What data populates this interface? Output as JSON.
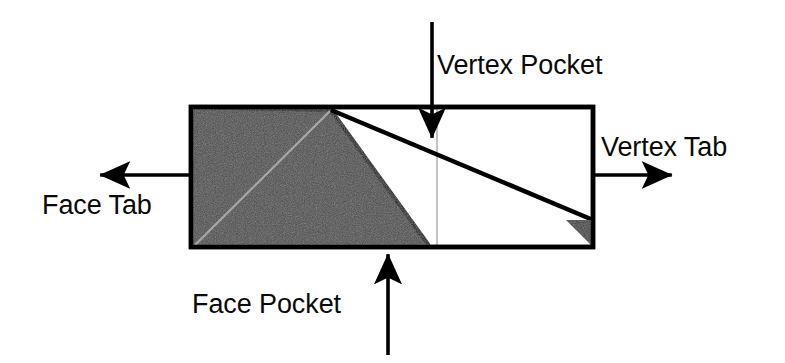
{
  "figure": {
    "colors": {
      "outline": "#000000",
      "fill_dark": "#4a4a4a",
      "fill_light": "#ffffff",
      "hint_line": "#a8a8a8",
      "text": "#0a0a0a",
      "background": "#ffffff"
    },
    "labels": {
      "vertex_pocket": "Vertex Pocket",
      "vertex_tab": "Vertex Tab",
      "face_tab": "Face Tab",
      "face_pocket": "Face Pocket"
    },
    "shape": {
      "name": "parallelogram-strip",
      "outline_points": "191,107 593,107 593,247 191,247",
      "dark_triangle_points": "191,107 331,110 430,247 191,247",
      "corner_triangle_points": "566,220 593,220 593,247",
      "crease_diagonal": {
        "x1": 195,
        "y1": 245,
        "x2": 330,
        "y2": 111
      },
      "long_diagonal": {
        "x1": 331,
        "y1": 110,
        "x2": 593,
        "y2": 220
      },
      "fold_line_vertical": {
        "x": 437,
        "y1": 108,
        "y2": 247
      }
    },
    "arrows": [
      {
        "name": "vertex-pocket-arrow",
        "direction": "down",
        "x1": 432,
        "y1": 22,
        "x2": 432,
        "y2": 142
      },
      {
        "name": "vertex-tab-arrow",
        "direction": "right",
        "x1": 593,
        "y1": 175,
        "x2": 676,
        "y2": 175
      },
      {
        "name": "face-tab-arrow",
        "direction": "left",
        "x1": 191,
        "y1": 175,
        "x2": 96,
        "y2": 175
      },
      {
        "name": "face-pocket-arrow",
        "direction": "up",
        "x1": 388,
        "y1": 355,
        "x2": 388,
        "y2": 250
      }
    ]
  }
}
